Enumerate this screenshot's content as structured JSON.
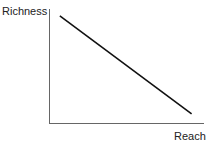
{
  "chart_data": {
    "type": "line",
    "title": "",
    "xlabel": "Reach",
    "ylabel": "Richness",
    "grid": false,
    "legend": null,
    "series": [
      {
        "name": "Richness vs Reach trade-off",
        "x": [
          0.07,
          0.92
        ],
        "y": [
          0.94,
          0.08
        ]
      }
    ],
    "xlim": [
      0,
      1
    ],
    "ylim": [
      0,
      1
    ]
  },
  "labels": {
    "y_axis": "Richness",
    "x_axis": "Reach"
  },
  "colors": {
    "line": "#111111",
    "axis": "#555555"
  }
}
